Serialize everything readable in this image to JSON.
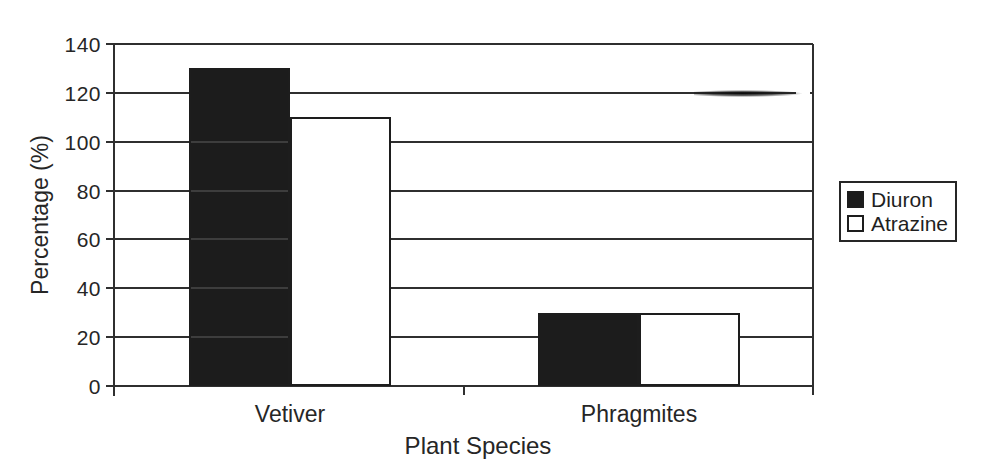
{
  "chart_data": {
    "type": "bar",
    "title": "",
    "xlabel": "Plant Species",
    "ylabel": "Percentage (%)",
    "categories": [
      "Vetiver",
      "Phragmites"
    ],
    "series": [
      {
        "name": "Diuron",
        "values": [
          130,
          30
        ],
        "fill": "#1c1c1c"
      },
      {
        "name": "Atrazine",
        "values": [
          110,
          30
        ],
        "fill": "#ffffff"
      }
    ],
    "ylim": [
      0,
      140
    ],
    "yticks": [
      0,
      20,
      40,
      60,
      80,
      100,
      120,
      140
    ],
    "grid": true,
    "legend": {
      "position": "right",
      "entries": [
        "Diuron",
        "Atrazine"
      ]
    },
    "colors": {
      "ink": "#262626",
      "axis": "#2f2f2f",
      "background": "#ffffff"
    }
  }
}
